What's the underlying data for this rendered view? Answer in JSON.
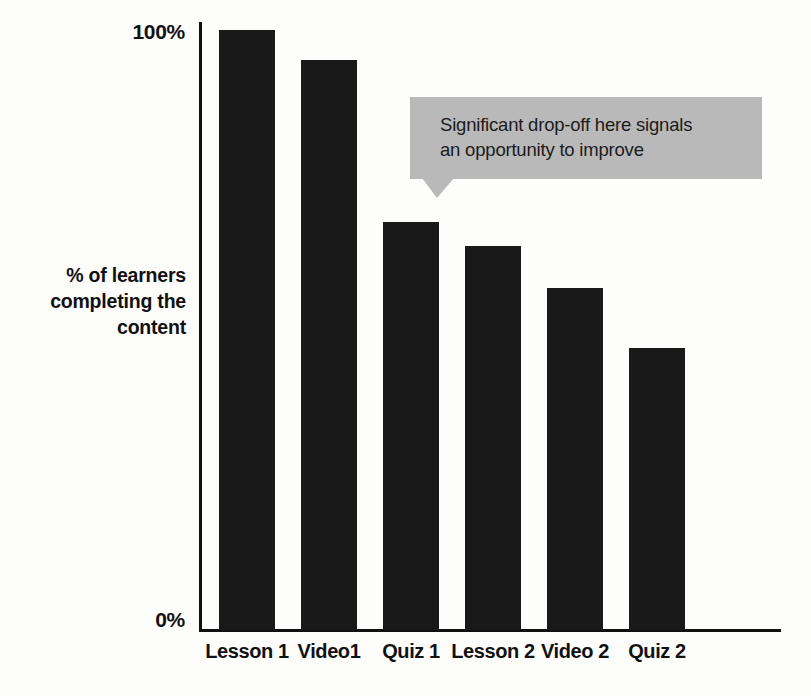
{
  "chart_data": {
    "type": "bar",
    "title": "",
    "subtitle": "",
    "xlabel": "",
    "ylabel": "% of learners completing the content",
    "categories": [
      "Lesson 1",
      "Video1",
      "Quiz 1",
      "Lesson 2",
      "Video 2",
      "Quiz 2"
    ],
    "values": [
      100,
      95,
      68,
      64,
      57,
      47
    ],
    "ylim": [
      0,
      100
    ],
    "ytick_labels": [
      "100%",
      "0%"
    ],
    "ytick_values": [
      100,
      0
    ],
    "grid": false,
    "legend": null,
    "bar_color": "#191919",
    "annotations": [
      {
        "text": "Significant drop-off here signals an opportunity to improve",
        "points_to_category": "Quiz 1",
        "style": "speech-bubble",
        "background": "#b9b9b9"
      }
    ]
  },
  "axes": {
    "y_title_lines": [
      "% of learners",
      "completing the",
      "content"
    ],
    "y_top_label": "100%",
    "y_zero_label": "0%"
  },
  "callout": {
    "line1": "Significant drop-off here signals",
    "line2": "an opportunity to improve",
    "full_text": "Significant drop-off here signals an opportunity to improve"
  },
  "bars": [
    {
      "label": "Lesson 1",
      "value": 100,
      "left": 219,
      "width": 56,
      "top": 30
    },
    {
      "label": "Video1",
      "value": 95,
      "left": 301,
      "width": 56,
      "top": 62
    },
    {
      "label": "Quiz 1",
      "value": 68,
      "left": 383,
      "width": 56,
      "top": 222
    },
    {
      "label": "Lesson 2",
      "value": 64,
      "left": 465,
      "width": 56,
      "top": 244
    },
    {
      "label": "Video 2",
      "value": 57,
      "left": 547,
      "width": 56,
      "top": 286
    },
    {
      "label": "Quiz 2",
      "value": 47,
      "left": 629,
      "width": 56,
      "top": 345
    }
  ],
  "page": {
    "bottom_fragment": ""
  },
  "colors": {
    "bar": "#191919",
    "callout_bg": "#b9b9b9",
    "axis": "#101010",
    "text": "#111111",
    "background": "#fdfdfc"
  }
}
